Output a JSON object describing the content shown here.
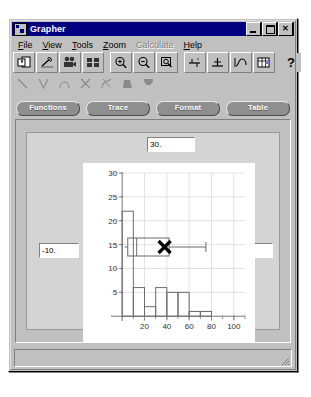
{
  "window": {
    "title": "Grapher",
    "icon": "app-window-icon",
    "buttons": [
      {
        "name": "minimize-button",
        "glyph": "_"
      },
      {
        "name": "maximize-button",
        "glyph": "□"
      },
      {
        "name": "close-button",
        "glyph": "✕"
      }
    ]
  },
  "menubar": {
    "items": [
      {
        "label": "File",
        "mnemonic": "F",
        "disabled": false
      },
      {
        "label": "View",
        "mnemonic": "V",
        "disabled": false
      },
      {
        "label": "Tools",
        "mnemonic": "T",
        "disabled": false
      },
      {
        "label": "Zoom",
        "mnemonic": "Z",
        "disabled": false
      },
      {
        "label": "Calculate",
        "mnemonic": "C",
        "disabled": true
      },
      {
        "label": "Help",
        "mnemonic": "H",
        "disabled": false
      }
    ]
  },
  "toolbar_primary": {
    "items": [
      {
        "name": "new-document-icon",
        "tooltip": "New"
      },
      {
        "name": "edit-function-icon",
        "tooltip": "Edit Function"
      },
      {
        "name": "animate-icon",
        "tooltip": "Animate"
      },
      {
        "name": "tile-windows-icon",
        "tooltip": "Tile"
      },
      {
        "name": "zoom-in-icon",
        "tooltip": "Zoom In"
      },
      {
        "name": "zoom-out-icon",
        "tooltip": "Zoom Out"
      },
      {
        "name": "zoom-box-icon",
        "tooltip": "Zoom Box"
      },
      {
        "name": "axis-x-icon",
        "tooltip": "X Axis"
      },
      {
        "name": "axis-y-icon",
        "tooltip": "Y Axis"
      },
      {
        "name": "trace-curve-icon",
        "tooltip": "Trace"
      },
      {
        "name": "data-table-icon",
        "tooltip": "Table"
      },
      {
        "name": "help-question-icon",
        "tooltip": "Help"
      }
    ]
  },
  "toolbar_secondary": {
    "items": [
      {
        "name": "line-plot-icon",
        "tooltip": "Line"
      },
      {
        "name": "v-curve-icon",
        "tooltip": "V Curve"
      },
      {
        "name": "arc-curve-icon",
        "tooltip": "Arc"
      },
      {
        "name": "cross-curve-icon",
        "tooltip": "Cross"
      },
      {
        "name": "tangent-icon",
        "tooltip": "Tangent"
      },
      {
        "name": "area-fill-icon",
        "tooltip": "Area Fill"
      },
      {
        "name": "parabola-fill-icon",
        "tooltip": "Parabola Fill"
      }
    ]
  },
  "action_buttons": [
    {
      "name": "functions-button",
      "label": "Functions"
    },
    {
      "name": "trace-button",
      "label": "Trace"
    },
    {
      "name": "format-button",
      "label": "Format"
    },
    {
      "name": "table-button",
      "label": "Table"
    }
  ],
  "graph_bounds": {
    "top": "30.",
    "bottom": "-1.",
    "left": "-10.",
    "right": "110."
  },
  "statusbar": {
    "text": ""
  },
  "chart_data": {
    "type": "bar",
    "title": "",
    "xlabel": "",
    "ylabel": "",
    "xlim": [
      -10,
      110
    ],
    "ylim": [
      -1,
      30
    ],
    "xticks": [
      20,
      40,
      60,
      80,
      100
    ],
    "yticks": [
      5,
      10,
      15,
      20,
      25,
      30
    ],
    "grid": true,
    "bin_width": 10,
    "bin_starts": [
      0,
      10,
      20,
      30,
      40,
      50,
      60,
      70
    ],
    "values": [
      22,
      6,
      2,
      6,
      5,
      5,
      1,
      1
    ],
    "overlay": {
      "type": "boxplot",
      "y": 14.5,
      "box_min": 5,
      "box_max": 42,
      "median": 13,
      "whisker_max": 75,
      "marker": "x-marker",
      "marker_x": 38
    }
  }
}
